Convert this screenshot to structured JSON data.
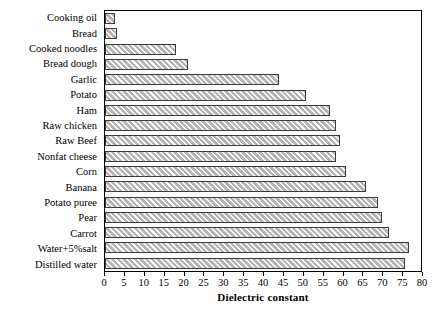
{
  "chart_data": {
    "type": "bar",
    "orientation": "horizontal",
    "title": "",
    "xlabel": "Dielectric constant",
    "ylabel": "",
    "xlim": [
      0,
      80
    ],
    "xticks": [
      0,
      5,
      10,
      15,
      20,
      25,
      30,
      35,
      40,
      45,
      50,
      55,
      60,
      65,
      70,
      75,
      80
    ],
    "grid": false,
    "legend": null,
    "bar_color": "#b5b5b5",
    "bar_edge_color": "#3c3c3c",
    "bar_pattern": "diagonal-hatch",
    "categories": [
      "Cooking oil",
      "Bread",
      "Cooked noodles",
      "Bread dough",
      "Garlic",
      "Potato",
      "Ham",
      "Raw chicken",
      "Raw Beef",
      "Nonfat cheese",
      "Corn",
      "Banana",
      "Potato puree",
      "Pear",
      "Carrot",
      "Water+5%salt",
      "Distilled water"
    ],
    "values": [
      2.5,
      3.0,
      18.0,
      21.0,
      44.0,
      51.0,
      57.0,
      58.5,
      59.5,
      58.5,
      61.0,
      66.0,
      69.0,
      70.0,
      72.0,
      77.0,
      76.0
    ]
  }
}
